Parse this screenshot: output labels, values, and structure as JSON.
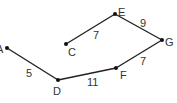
{
  "diagram": {
    "type": "weighted-path-graph",
    "nodes": [
      {
        "id": "A",
        "label": "A",
        "x": 7,
        "y": 48
      },
      {
        "id": "D",
        "label": "D",
        "x": 58,
        "y": 80
      },
      {
        "id": "F",
        "label": "F",
        "x": 116,
        "y": 68
      },
      {
        "id": "G",
        "label": "G",
        "x": 162,
        "y": 40
      },
      {
        "id": "E",
        "label": "E",
        "x": 115,
        "y": 14
      },
      {
        "id": "C",
        "label": "C",
        "x": 66,
        "y": 44
      }
    ],
    "edges": [
      {
        "from": "A",
        "to": "D",
        "weight": "5"
      },
      {
        "from": "D",
        "to": "F",
        "weight": "11"
      },
      {
        "from": "F",
        "to": "G",
        "weight": "7"
      },
      {
        "from": "G",
        "to": "E",
        "weight": "9"
      },
      {
        "from": "E",
        "to": "C",
        "weight": "7"
      }
    ]
  }
}
